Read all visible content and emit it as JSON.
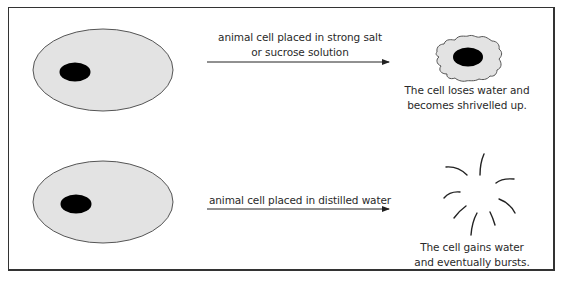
{
  "diagram": {
    "colors": {
      "cytoplasm": "#e3e3e3",
      "outline": "#555555",
      "nucleus": "#000000",
      "text": "#2a2a2a",
      "frame": "#333333"
    },
    "rows": [
      {
        "arrow_label_line1": "animal cell placed in strong salt",
        "arrow_label_line2": "or sucrose solution",
        "result_state": "shrivelled",
        "result_caption_line1": "The cell loses water and",
        "result_caption_line2": "becomes shrivelled up."
      },
      {
        "arrow_label_line1": "animal cell placed in distilled water",
        "result_state": "burst",
        "result_caption_line1": "The cell gains water",
        "result_caption_line2": "and eventually bursts."
      }
    ]
  }
}
